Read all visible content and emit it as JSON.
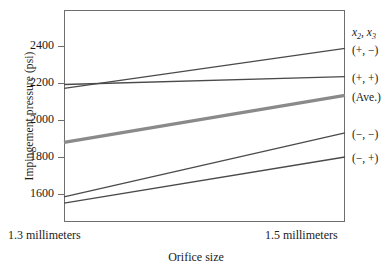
{
  "chart_data": {
    "type": "line",
    "title": "",
    "xlabel": "Orifice size",
    "ylabel": "Impingement pressure (psi)",
    "x": [
      "1.3 millimeters",
      "1.5 millimeters"
    ],
    "xtick_labels": [
      "1.3 millimeters",
      "1.5 millimeters"
    ],
    "ytick_labels": [
      "2400",
      "2200",
      "2000",
      "1800",
      "1600"
    ],
    "ytick_values": [
      2400,
      2200,
      2000,
      1800,
      1600
    ],
    "ylim": [
      1500,
      2460
    ],
    "grid": false,
    "legend_position": "right-outside",
    "legend_header": "x2, x3",
    "legend_header_base": "x",
    "legend_header_sub1": "2",
    "legend_header_sep": ", x",
    "legend_header_sub2": "3",
    "series": [
      {
        "name": "(+, −)",
        "values": [
          2171,
          2387
        ],
        "color": "#4a4a4a",
        "width": 1.3,
        "style": "solid"
      },
      {
        "name": "(+, +)",
        "values": [
          2192,
          2235
        ],
        "color": "#4a4a4a",
        "width": 1.3,
        "style": "solid"
      },
      {
        "name": "(Ave.)",
        "values": [
          1879,
          2133
        ],
        "color": "#8a8a8a",
        "width": 3.2,
        "style": "solid"
      },
      {
        "name": "(−, −)",
        "values": [
          1584,
          1930
        ],
        "color": "#4a4a4a",
        "width": 1.3,
        "style": "solid"
      },
      {
        "name": "(−, +)",
        "values": [
          1551,
          1800
        ],
        "color": "#4a4a4a",
        "width": 1.3,
        "style": "solid"
      }
    ]
  },
  "axis": {
    "y_title": "Impingement pressure (psi)",
    "x_title": "Orifice size",
    "x_left": "1.3 millimeters",
    "x_right": "1.5 millimeters",
    "yticks": [
      {
        "label": "2400"
      },
      {
        "label": "2200"
      },
      {
        "label": "2000"
      },
      {
        "label": "1800"
      },
      {
        "label": "1600"
      }
    ]
  },
  "legend": {
    "header_x": "x",
    "header_sub2": "2",
    "header_mid": ", x",
    "header_sub3": "3",
    "items": [
      {
        "label": "(+, −)"
      },
      {
        "label": "(+, +)"
      },
      {
        "label": "(Ave.)"
      },
      {
        "label": "(−, −)"
      },
      {
        "label": "(−, +)"
      }
    ]
  },
  "colors": {
    "frame": "#6e6e6e",
    "line": "#4a4a4a",
    "average_line": "#8a8a8a",
    "text": "#1a1a1a",
    "background": "#ffffff"
  }
}
